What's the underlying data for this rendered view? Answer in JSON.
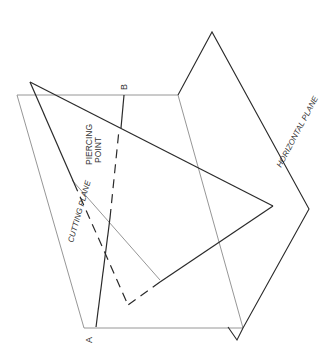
{
  "diagram": {
    "labels": {
      "point_a": "A",
      "point_b": "B",
      "piercing_point_line1": "PIERCING",
      "piercing_point_line2": "POINT",
      "cutting_plane": "CUTTING  PLANE",
      "horizontal_plane": "HORIZONTAL  PLANE"
    },
    "colors": {
      "background": "#ffffff",
      "bold_line": "#2a2a2a",
      "thin_line": "#8a8a8a",
      "text": "#333333"
    }
  }
}
